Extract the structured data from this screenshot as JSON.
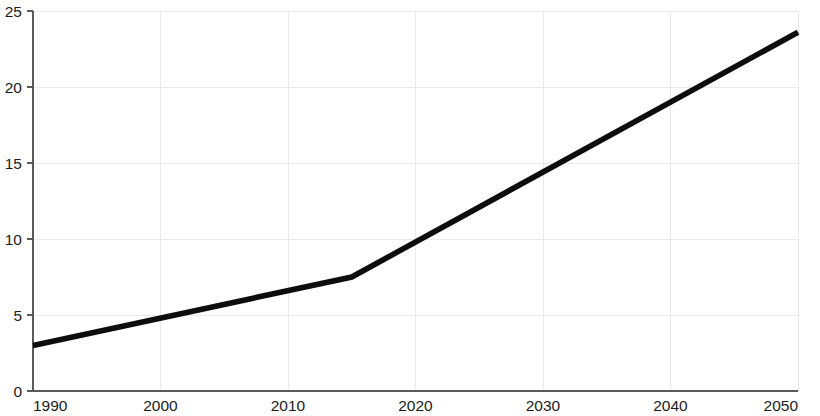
{
  "chart_data": {
    "type": "line",
    "title": "",
    "subtitle": "",
    "xlabel": "",
    "ylabel": "",
    "x": [
      1990,
      2015,
      2050
    ],
    "series": [
      {
        "name": "",
        "values": [
          3.0,
          7.5,
          23.6
        ]
      }
    ],
    "xlim": [
      1990,
      2050
    ],
    "ylim": [
      0,
      25
    ],
    "xticks": [
      1990,
      2000,
      2010,
      2020,
      2030,
      2040,
      2050
    ],
    "xtick_labels": [
      "1990",
      "2000",
      "2010",
      "2020",
      "2030",
      "2040",
      "2050"
    ],
    "yticks": [
      0,
      5,
      10,
      15,
      20,
      25
    ],
    "ytick_labels": [
      "0",
      "5",
      "10",
      "15",
      "20",
      "25"
    ],
    "grid": true,
    "grid_axis": "both",
    "legend": false,
    "legend_position": "none",
    "annotations": [],
    "colors": {
      "line": "#0d0d0d",
      "grid": "#e9e9e9",
      "axis": "#5a5a5a",
      "text": "#1b1b1b",
      "background": "#ffffff"
    }
  },
  "geometry": {
    "width": 820,
    "height": 416,
    "plot_left": 33,
    "plot_right": 798,
    "plot_top": 11,
    "plot_bottom": 391
  }
}
